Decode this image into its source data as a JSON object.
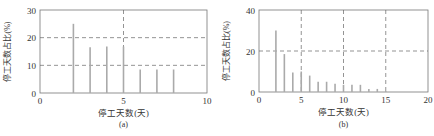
{
  "chart_data": [
    {
      "type": "bar",
      "panel": "(a)",
      "xlabel": "停工天数(天)",
      "ylabel": "停工天数占比(%)",
      "xlim": [
        0,
        10
      ],
      "ylim": [
        0,
        30
      ],
      "xticks": [
        0,
        5,
        10
      ],
      "yticks": [
        0,
        10,
        20,
        30
      ],
      "grid_h": [
        10,
        20
      ],
      "grid_v": [
        5
      ],
      "x": [
        2,
        3,
        4,
        5,
        6,
        7,
        8
      ],
      "values": [
        25,
        16.5,
        16.8,
        16.8,
        8.5,
        8.5,
        8.5
      ],
      "bar_color": "#aaaaaa"
    },
    {
      "type": "bar",
      "panel": "(b)",
      "xlabel": "停工天数(天)",
      "ylabel": "停工天数占比(%)",
      "xlim": [
        0,
        20
      ],
      "ylim": [
        0,
        40
      ],
      "xticks": [
        0,
        5,
        10,
        15,
        20
      ],
      "yticks": [
        0,
        20,
        40
      ],
      "grid_h": [
        20
      ],
      "grid_v": [
        5,
        10,
        15
      ],
      "x": [
        2,
        3,
        4,
        5,
        6,
        7,
        8,
        9,
        10,
        11,
        12,
        13,
        14,
        15
      ],
      "values": [
        30,
        18.5,
        9.5,
        10,
        8,
        5,
        5,
        4,
        3.5,
        3.5,
        3.5,
        1.5,
        1.5,
        0.5
      ],
      "bar_color": "#aaaaaa"
    }
  ],
  "panels": [
    {
      "caption": "(a)"
    },
    {
      "caption": "(b)"
    }
  ]
}
